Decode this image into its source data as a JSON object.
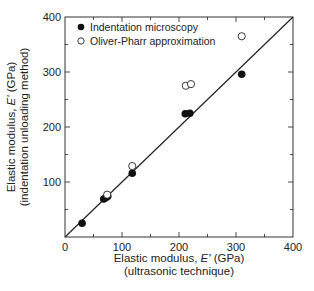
{
  "chart_data": {
    "type": "scatter",
    "title": "",
    "xlabel": "Elastic modulus, E' (GPa)",
    "xlabel_sub": "(ultrasonic technique)",
    "ylabel": "Elastic modulus, E' (GPa)",
    "ylabel_sub": "(indentation unloading method)",
    "xlim": [
      0,
      400
    ],
    "ylim": [
      0,
      400
    ],
    "x_ticks": [
      0,
      100,
      200,
      300,
      400
    ],
    "y_ticks": [
      100,
      200,
      300,
      400
    ],
    "minor_tick_step": 50,
    "grid": false,
    "legend_position": "upper-left",
    "reference_line": {
      "label": "y = x",
      "from": [
        0,
        0
      ],
      "to": [
        400,
        400
      ]
    },
    "series": [
      {
        "name": "Indentation microscopy",
        "marker": "filled-circle",
        "points": [
          [
            30,
            25
          ],
          [
            68,
            69
          ],
          [
            72,
            72
          ],
          [
            75,
            74
          ],
          [
            118,
            116
          ],
          [
            211,
            224
          ],
          [
            219,
            225
          ],
          [
            310,
            296
          ]
        ]
      },
      {
        "name": "Oliver-Pharr approximation",
        "marker": "open-circle",
        "points": [
          [
            74,
            77
          ],
          [
            118,
            129
          ],
          [
            212,
            275
          ],
          [
            221,
            278
          ],
          [
            310,
            365
          ]
        ]
      }
    ]
  },
  "labels": {
    "x_tick_0": "0",
    "x_tick_100": "100",
    "x_tick_200": "200",
    "x_tick_300": "300",
    "x_tick_400": "400",
    "y_tick_100": "100",
    "y_tick_200": "200",
    "y_tick_300": "300",
    "y_tick_400": "400",
    "xlabel_main": "Elastic modulus, ",
    "xlabel_var": "E'",
    "xlabel_unit": " (GPa)",
    "xlabel_sub": "(ultrasonic technique)",
    "ylabel_main": "Elastic modulus, ",
    "ylabel_var": "E'",
    "ylabel_unit": " (GPa)",
    "ylabel_sub": "(indentation unloading method)",
    "legend_filled": "Indentation microscopy",
    "legend_open": "Oliver-Pharr approximation"
  },
  "colors": {
    "ink": "#222222",
    "background": "#ffffff"
  }
}
